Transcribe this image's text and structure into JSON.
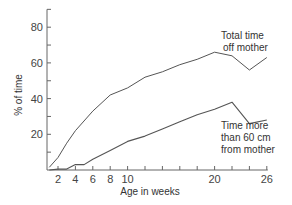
{
  "chart_data": {
    "type": "line",
    "title": "",
    "xlabel": "Age in weeks",
    "ylabel": "% of time",
    "xlim": [
      1,
      26
    ],
    "ylim": [
      0,
      90
    ],
    "x_ticks": [
      2,
      4,
      6,
      8,
      10,
      12,
      14,
      16,
      18,
      20,
      22,
      24,
      26
    ],
    "x_tick_labels": [
      "2",
      "4",
      "6",
      "8",
      "10",
      "",
      "",
      "",
      "",
      "20",
      "",
      "",
      "26"
    ],
    "y_ticks": [
      10,
      20,
      30,
      40,
      50,
      60,
      70,
      80,
      90
    ],
    "y_tick_labels": [
      "",
      "20",
      "",
      "40",
      "",
      "60",
      "",
      "80",
      ""
    ],
    "grid": false,
    "legend": "none (inline annotations)",
    "series": [
      {
        "name": "Total time off mother",
        "x": [
          1,
          2,
          3,
          4,
          6,
          8,
          10,
          12,
          14,
          16,
          18,
          20,
          22,
          24,
          26
        ],
        "values": [
          1.5,
          7,
          15,
          22,
          33,
          42,
          46,
          52,
          55,
          59,
          62,
          66,
          64,
          56,
          63
        ]
      },
      {
        "name": "Time more than 60 cm from mother",
        "x": [
          1,
          2,
          3,
          4,
          5,
          6,
          8,
          10,
          12,
          14,
          16,
          18,
          20,
          22,
          24,
          26
        ],
        "values": [
          0,
          0.5,
          0.5,
          3,
          3,
          6,
          11,
          16,
          19,
          23,
          27,
          31,
          34,
          38,
          26,
          28
        ]
      }
    ],
    "annotations": [
      {
        "text_lines": [
          "Total time",
          "off mother"
        ],
        "series": 0
      },
      {
        "text_lines": [
          "Time more",
          "than 60 cm",
          "from mother"
        ],
        "series": 1
      }
    ]
  },
  "labels": {
    "y_axis": "% of time",
    "x_axis": "Age in weeks",
    "annot_total_1": "Total time",
    "annot_total_2": "off mother",
    "annot_dist_1": "Time more",
    "annot_dist_2": "than 60 cm",
    "annot_dist_3": "from mother"
  },
  "colors": {
    "line": "#555555",
    "axis": "#666666"
  }
}
